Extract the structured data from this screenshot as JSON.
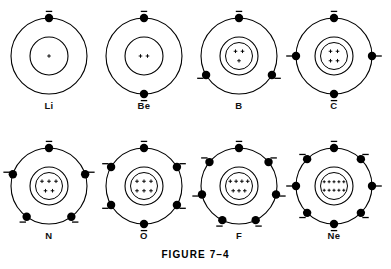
{
  "figure": {
    "caption": "FIGURE 7–4",
    "width": 391,
    "height": 269,
    "background_color": "#ffffff",
    "stroke_color": "#000000",
    "electron_color": "#000000"
  },
  "chart_data": {
    "type": "diagram",
    "title": "FIGURE 7–4",
    "subtitle": "",
    "rows": 2,
    "columns": 4,
    "atoms": [
      {
        "symbol": "Li",
        "nucleus_charges": 1,
        "nucleus_rows": [
          1
        ],
        "shells": 2,
        "inner_shell_electrons": 0,
        "outer_shell_electrons": 1,
        "outer_electron_angles_deg": [
          90
        ]
      },
      {
        "symbol": "Be",
        "nucleus_charges": 2,
        "nucleus_rows": [
          2
        ],
        "shells": 2,
        "inner_shell_electrons": 0,
        "outer_shell_electrons": 2,
        "outer_electron_angles_deg": [
          90,
          270
        ]
      },
      {
        "symbol": "B",
        "nucleus_charges": 3,
        "nucleus_rows": [
          2,
          1
        ],
        "shells": 2,
        "inner_shell_electrons": 0,
        "outer_shell_electrons": 3,
        "outer_electron_angles_deg": [
          90,
          210,
          330
        ]
      },
      {
        "symbol": "C",
        "nucleus_charges": 4,
        "nucleus_rows": [
          2,
          2
        ],
        "shells": 2,
        "inner_shell_electrons": 0,
        "outer_shell_electrons": 4,
        "outer_electron_angles_deg": [
          90,
          180,
          270,
          0
        ]
      },
      {
        "symbol": "N",
        "nucleus_charges": 5,
        "nucleus_rows": [
          3,
          2
        ],
        "shells": 2,
        "inner_shell_electrons": 0,
        "outer_shell_electrons": 5,
        "outer_electron_angles_deg": [
          90,
          162,
          18,
          234,
          306
        ]
      },
      {
        "symbol": "O",
        "nucleus_charges": 6,
        "nucleus_rows": [
          3,
          3
        ],
        "shells": 2,
        "inner_shell_electrons": 0,
        "outer_shell_electrons": 6,
        "outer_electron_angles_deg": [
          90,
          150,
          30,
          210,
          330,
          270
        ]
      },
      {
        "symbol": "F",
        "nucleus_charges": 7,
        "nucleus_rows": [
          4,
          3
        ],
        "shells": 2,
        "inner_shell_electrons": 0,
        "outer_shell_electrons": 7,
        "outer_electron_angles_deg": [
          90,
          141,
          39,
          193,
          347,
          244,
          296
        ]
      },
      {
        "symbol": "Ne",
        "nucleus_charges": 10,
        "nucleus_rows": [
          5,
          5
        ],
        "shells": 2,
        "inner_shell_electrons": 0,
        "outer_shell_electrons": 8,
        "outer_electron_angles_deg": [
          90,
          135,
          180,
          225,
          270,
          315,
          0,
          45
        ]
      }
    ]
  }
}
